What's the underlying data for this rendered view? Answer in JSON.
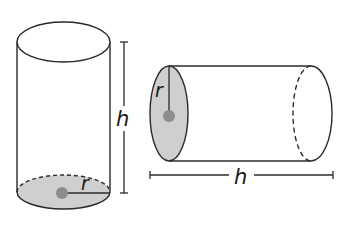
{
  "diagram": {
    "type": "geometry-cylinders",
    "figures": [
      {
        "name": "upright-cylinder",
        "orientation": "vertical",
        "labels": {
          "radius": "r",
          "height": "h"
        }
      },
      {
        "name": "horizontal-cylinder",
        "orientation": "horizontal",
        "labels": {
          "radius": "r",
          "height": "h"
        }
      }
    ],
    "colors": {
      "stroke": "#2a2a2a",
      "base_fill": "#cfcfcf",
      "center_dot": "#8c8c8c",
      "background": "#ffffff"
    }
  }
}
